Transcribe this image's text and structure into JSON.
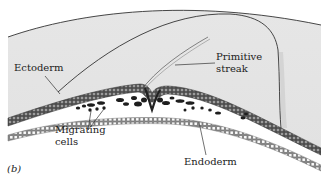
{
  "diagram": {
    "panel_label": "(b)",
    "labels": {
      "ectoderm": "Ectoderm",
      "primitive_streak_line1": "Primitive",
      "primitive_streak_line2": "streak",
      "migrating_line1": "Migrating",
      "migrating_line2": "cells",
      "endoderm": "Endoderm"
    },
    "colors": {
      "background": "#ffffff",
      "blastoderm_fill": "#e4e4e4",
      "outline": "#333333",
      "ectoderm_cells": "#5a5a5a",
      "endoderm_cells": "#9a9a9a",
      "migrating_cells": "#1e1e1e",
      "text": "#222222"
    }
  }
}
